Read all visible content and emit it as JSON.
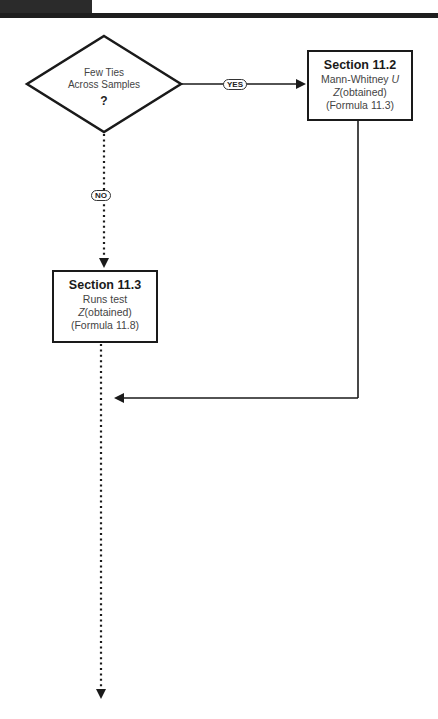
{
  "header": {
    "cut_off_text": ""
  },
  "decision": {
    "line1": "Few Ties",
    "line2": "Across Samples",
    "symbol": "?"
  },
  "branches": {
    "yes_label": "YES",
    "no_label": "NO"
  },
  "box_11_2": {
    "title": "Section 11.2",
    "test_prefix": "Mann-Whitney ",
    "test_italic": "U",
    "stat_italic": "Z",
    "stat_rest": "(obtained)",
    "formula": "(Formula 11.3)"
  },
  "box_11_3": {
    "title": "Section 11.3",
    "test": "Runs test",
    "stat_italic": "Z",
    "stat_rest": "(obtained)",
    "formula": "(Formula 11.8)"
  },
  "colors": {
    "line": "#1a1a1a",
    "text_dark": "#1a1a1a",
    "text_body": "#444444"
  }
}
